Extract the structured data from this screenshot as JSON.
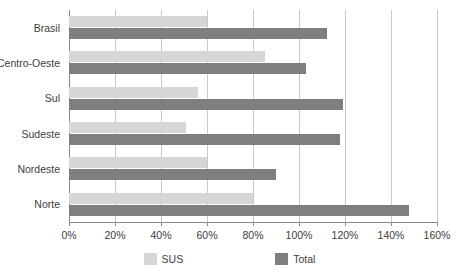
{
  "chart_data": {
    "type": "bar",
    "orientation": "horizontal",
    "title": "",
    "subtitle": "",
    "xlabel": "",
    "ylabel": "",
    "xlim": [
      0,
      160
    ],
    "xticks": [
      0,
      20,
      40,
      60,
      80,
      100,
      120,
      140,
      160
    ],
    "xtick_labels": [
      "0%",
      "20%",
      "40%",
      "60%",
      "80%",
      "100%",
      "120%",
      "140%",
      "160%"
    ],
    "grid": true,
    "grid_axis": "x",
    "legend_position": "bottom",
    "categories": [
      "Brasil",
      "Centro-Oeste",
      "Sul",
      "Sudeste",
      "Nordeste",
      "Norte"
    ],
    "series": [
      {
        "name": "SUS",
        "color": "#d6d6d6",
        "values": [
          60,
          85,
          56,
          51,
          60,
          80
        ]
      },
      {
        "name": "Total",
        "color": "#7f7f7f",
        "values": [
          112,
          103,
          119,
          118,
          90,
          148
        ]
      }
    ]
  },
  "legend": {
    "items": [
      {
        "label": "SUS",
        "swatch": "sus"
      },
      {
        "label": "Total",
        "swatch": "total"
      }
    ]
  },
  "colors": {
    "sus": "#d6d6d6",
    "total": "#7f7f7f",
    "gridline": "#c9c9c9",
    "axis": "#8a8a8a",
    "text": "#3d3d3d",
    "background": "#ffffff"
  }
}
